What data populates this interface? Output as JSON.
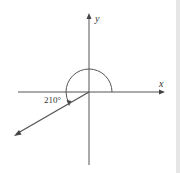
{
  "diagram": {
    "axes": {
      "x_label": "x",
      "y_label": "y"
    },
    "angle": {
      "label": "210°",
      "degrees": 210
    },
    "colors": {
      "line": "#555555",
      "background": "#ffffff",
      "side_bar": "#e6e6e6"
    }
  }
}
